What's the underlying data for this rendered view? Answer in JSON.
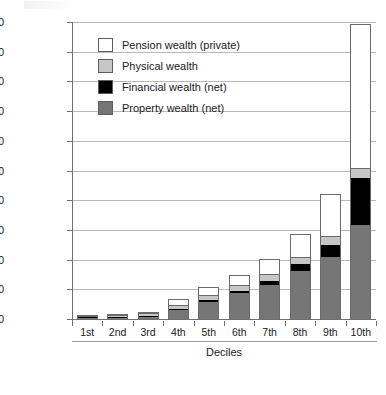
{
  "chart_data": {
    "type": "bar",
    "stacked": true,
    "title": "",
    "xlabel": "Deciles",
    "ylabel": "",
    "ylim": [
      0,
      4000000
    ],
    "ytick_step": 400000,
    "grid": true,
    "legend_position": "inside-top-left",
    "categories": [
      "1st",
      "2nd",
      "3rd",
      "4th",
      "5th",
      "6th",
      "7th",
      "8th",
      "9th",
      "10th"
    ],
    "ytick_labels": [
      "0",
      "400,000",
      "800,000",
      "1,200,000",
      "1,600,000",
      "2,000,000",
      "2,400,000",
      "2,800,000",
      "3,200,000",
      "3,600,000",
      "4,000,000"
    ],
    "ytick_values": [
      0,
      400000,
      800000,
      1200000,
      1600000,
      2000000,
      2400000,
      2800000,
      3200000,
      3600000,
      4000000
    ],
    "series": [
      {
        "name": "Property wealth (net)",
        "color": "#767676",
        "values": [
          2000,
          8000,
          30000,
          115000,
          235000,
          350000,
          460000,
          640000,
          830000,
          1260000
        ]
      },
      {
        "name": "Financial wealth (net)",
        "color": "#000000",
        "values": [
          6000,
          3000,
          6000,
          14000,
          20000,
          30000,
          55000,
          100000,
          170000,
          640000
        ]
      },
      {
        "name": "Physical wealth",
        "color": "#c6c6c6",
        "values": [
          4000,
          14000,
          30000,
          40000,
          50000,
          62000,
          75000,
          85000,
          100000,
          120000
        ]
      },
      {
        "name": "Pension wealth (private)",
        "color": "#ffffff",
        "values": [
          2000,
          5000,
          18000,
          95000,
          130000,
          150000,
          215000,
          320000,
          590000,
          1960000
        ]
      }
    ],
    "totals": [
      14000,
      30000,
      84000,
      264000,
      435000,
      592000,
      805000,
      1145000,
      1690000,
      3980000
    ]
  },
  "legend": {
    "items": [
      {
        "label": "Pension wealth (private)",
        "swatch": "white-square-icon"
      },
      {
        "label": "Physical wealth",
        "swatch": "light-gray-square-icon"
      },
      {
        "label": "Financial wealth (net)",
        "swatch": "black-square-icon"
      },
      {
        "label": "Property wealth (net)",
        "swatch": "gray-square-icon"
      }
    ]
  }
}
